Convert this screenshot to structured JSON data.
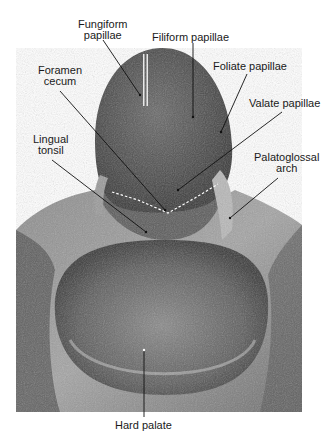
{
  "figure": {
    "colors": {
      "background": "#ffffff",
      "label_text": "#1a1a1a",
      "leader_line": "#111111",
      "dashed_line": "#ffffff"
    },
    "labels": [
      {
        "id": "fungiform-papillae",
        "lines": [
          "Fungiform",
          "papillae"
        ]
      },
      {
        "id": "filiform-papillae",
        "lines": [
          "Filiform papillae"
        ]
      },
      {
        "id": "foliate-papillae",
        "lines": [
          "Foliate papillae"
        ]
      },
      {
        "id": "foramen-cecum",
        "lines": [
          "Foramen",
          "cecum"
        ]
      },
      {
        "id": "valate-papillae",
        "lines": [
          "Valate papillae"
        ]
      },
      {
        "id": "lingual-tonsil",
        "lines": [
          "Lingual",
          "tonsil"
        ]
      },
      {
        "id": "palatoglossal-arch",
        "lines": [
          "Palatoglossal",
          "arch"
        ]
      },
      {
        "id": "hard-palate",
        "lines": [
          "Hard palate"
        ]
      }
    ]
  }
}
